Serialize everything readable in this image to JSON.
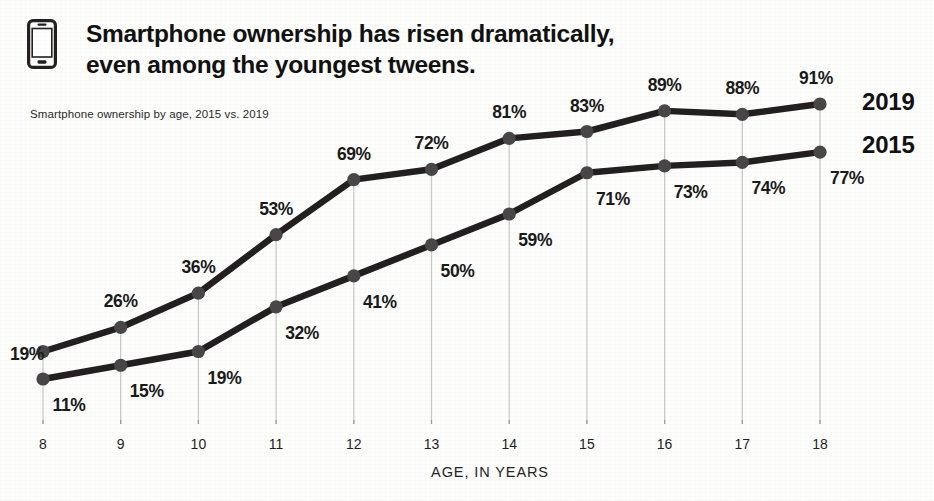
{
  "header": {
    "icon": "smartphone-icon",
    "title_line1": "Smartphone ownership has risen dramatically,",
    "title_line2": "even among the youngest tweens.",
    "subtitle": "Smartphone ownership by age, 2015 vs. 2019"
  },
  "colors": {
    "series_2019": "#231f20",
    "series_2015": "#2e2a2b",
    "marker": "#4a4648",
    "gridline": "#c9c7c5",
    "text": "#1a1a1a",
    "background": "#fdfdfc"
  },
  "chart_data": {
    "type": "line",
    "title": "Smartphone ownership has risen dramatically, even among the youngest tweens.",
    "subtitle": "Smartphone ownership by age, 2015 vs. 2019",
    "xlabel": "AGE, IN YEARS",
    "ylabel": "",
    "categories": [
      "8",
      "9",
      "10",
      "11",
      "12",
      "13",
      "14",
      "15",
      "16",
      "17",
      "18"
    ],
    "x": [
      8,
      9,
      10,
      11,
      12,
      13,
      14,
      15,
      16,
      17,
      18
    ],
    "ylim": [
      0,
      100
    ],
    "grid": "vertical",
    "legend_position": "right-inline",
    "series": [
      {
        "name": "2019",
        "values": [
          19,
          26,
          36,
          53,
          69,
          72,
          81,
          83,
          89,
          88,
          91
        ],
        "labels": [
          "19%",
          "26%",
          "36%",
          "53%",
          "69%",
          "72%",
          "81%",
          "83%",
          "89%",
          "88%",
          "91%"
        ]
      },
      {
        "name": "2015",
        "values": [
          11,
          15,
          19,
          32,
          41,
          50,
          59,
          71,
          73,
          74,
          77
        ],
        "labels": [
          "11%",
          "15%",
          "19%",
          "32%",
          "41%",
          "50%",
          "59%",
          "71%",
          "73%",
          "74%",
          "77%"
        ]
      }
    ]
  }
}
